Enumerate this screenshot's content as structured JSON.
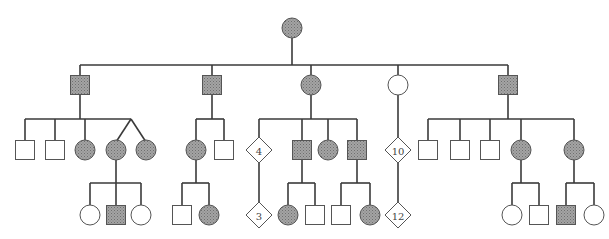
{
  "diagram": {
    "type": "pedigree",
    "colors": {
      "affected_fill": "#9c9c9c",
      "stipple": "#7a7a7a",
      "unaffected_fill": "#ffffff",
      "line": "#3a3a3a"
    },
    "generations": [
      {
        "id": "I",
        "individuals": [
          {
            "id": "I-1",
            "sex": "female",
            "affected": true
          }
        ]
      },
      {
        "id": "II",
        "individuals": [
          {
            "id": "II-1",
            "sex": "male",
            "affected": true,
            "parent": "I-1"
          },
          {
            "id": "II-2",
            "sex": "male",
            "affected": true,
            "parent": "I-1"
          },
          {
            "id": "II-3",
            "sex": "female",
            "affected": true,
            "parent": "I-1"
          },
          {
            "id": "II-4",
            "sex": "female",
            "affected": false,
            "parent": "I-1"
          },
          {
            "id": "II-5",
            "sex": "male",
            "affected": true,
            "parent": "I-1"
          }
        ]
      },
      {
        "id": "III",
        "individuals": [
          {
            "id": "III-1",
            "sex": "male",
            "affected": false,
            "parent": "II-1"
          },
          {
            "id": "III-2",
            "sex": "male",
            "affected": false,
            "parent": "II-1"
          },
          {
            "id": "III-3",
            "sex": "female",
            "affected": true,
            "parent": "II-1"
          },
          {
            "id": "III-4",
            "sex": "female",
            "affected": true,
            "parent": "II-1",
            "twin_group": "A"
          },
          {
            "id": "III-5",
            "sex": "female",
            "affected": true,
            "parent": "II-1",
            "twin_group": "A"
          },
          {
            "id": "III-6",
            "sex": "female",
            "affected": true,
            "parent": "II-2"
          },
          {
            "id": "III-7",
            "sex": "male",
            "affected": false,
            "parent": "II-2"
          },
          {
            "id": "III-8",
            "sex": "unknown",
            "affected": false,
            "count": "4",
            "parent": "II-3"
          },
          {
            "id": "III-9",
            "sex": "male",
            "affected": true,
            "parent": "II-3"
          },
          {
            "id": "III-10",
            "sex": "female",
            "affected": true,
            "parent": "II-3"
          },
          {
            "id": "III-11",
            "sex": "male",
            "affected": true,
            "parent": "II-3"
          },
          {
            "id": "III-12",
            "sex": "unknown",
            "affected": false,
            "count": "10",
            "parent": "II-4"
          },
          {
            "id": "III-13",
            "sex": "male",
            "affected": false,
            "parent": "II-5"
          },
          {
            "id": "III-14",
            "sex": "male",
            "affected": false,
            "parent": "II-5"
          },
          {
            "id": "III-15",
            "sex": "male",
            "affected": false,
            "parent": "II-5"
          },
          {
            "id": "III-16",
            "sex": "female",
            "affected": true,
            "parent": "II-5"
          },
          {
            "id": "III-17",
            "sex": "female",
            "affected": true,
            "parent": "II-5"
          }
        ]
      },
      {
        "id": "IV",
        "individuals": [
          {
            "id": "IV-1",
            "sex": "female",
            "affected": false,
            "parent": "III-4"
          },
          {
            "id": "IV-2",
            "sex": "male",
            "affected": true,
            "parent": "III-4"
          },
          {
            "id": "IV-3",
            "sex": "female",
            "affected": false,
            "parent": "III-4"
          },
          {
            "id": "IV-4",
            "sex": "male",
            "affected": false,
            "parent": "III-6"
          },
          {
            "id": "IV-5",
            "sex": "female",
            "affected": true,
            "parent": "III-6"
          },
          {
            "id": "IV-6",
            "sex": "unknown",
            "affected": false,
            "count": "3",
            "parent": "III-8"
          },
          {
            "id": "IV-7",
            "sex": "female",
            "affected": true,
            "parent": "III-9"
          },
          {
            "id": "IV-8",
            "sex": "male",
            "affected": false,
            "parent": "III-9"
          },
          {
            "id": "IV-9",
            "sex": "male",
            "affected": false,
            "parent": "III-11"
          },
          {
            "id": "IV-10",
            "sex": "female",
            "affected": true,
            "parent": "III-11"
          },
          {
            "id": "IV-11",
            "sex": "unknown",
            "affected": false,
            "count": "12",
            "parent": "III-12"
          },
          {
            "id": "IV-12",
            "sex": "female",
            "affected": false,
            "parent": "III-16"
          },
          {
            "id": "IV-13",
            "sex": "male",
            "affected": false,
            "parent": "III-16"
          },
          {
            "id": "IV-14",
            "sex": "male",
            "affected": true,
            "parent": "III-17"
          },
          {
            "id": "IV-15",
            "sex": "female",
            "affected": false,
            "parent": "III-17"
          }
        ]
      }
    ]
  }
}
